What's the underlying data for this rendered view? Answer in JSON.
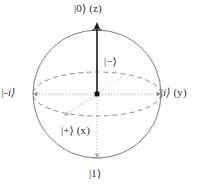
{
  "figure": {
    "name": "bloch-sphere",
    "background_color": "#ffffff",
    "sphere": {
      "center_x": 97,
      "center_y": 94,
      "radius": 64,
      "outline_color": "#7a7a7a",
      "outline_width": 1
    },
    "equator": {
      "rx": 64,
      "ry": 22,
      "style": "dashed",
      "color": "#8a8a8a"
    },
    "axes": {
      "z_axis": {
        "label": "z",
        "style": "solid",
        "color": "#1a1a1a",
        "arrow": true
      },
      "y_axis": {
        "label": "y",
        "style": "dotted",
        "color": "#9a9a9a",
        "arrow": true
      },
      "x_axis": {
        "label": "x",
        "style": "dotted",
        "color": "#b0b0b0",
        "arrow": true
      }
    },
    "origin_dot": {
      "color": "#111111",
      "size": 4
    }
  },
  "labels": {
    "north_pole": "|0⟩ (z)",
    "south_pole": "|1⟩",
    "right_pole": "|i⟩ (y)",
    "left_pole": "|-i⟩",
    "front_pole": "|+⟩ (x)",
    "back_pole": "|−⟩"
  },
  "label_parts": {
    "north_pole_ket": "|0⟩",
    "north_pole_axis": "(z)",
    "right_pole_ket": "|i⟩",
    "right_pole_axis": "(y)",
    "left_pole_ket": "|-i⟩",
    "front_pole_ket": "|+⟩",
    "front_pole_axis": "(x)",
    "south_pole_ket": "|1⟩",
    "back_pole_ket": "|−⟩"
  }
}
